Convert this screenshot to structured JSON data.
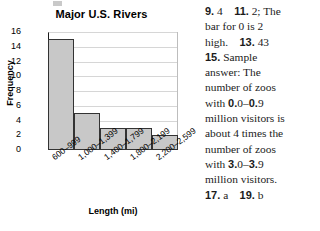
{
  "artifact": {
    "name": "page-edge-mark"
  },
  "chart_data": {
    "type": "bar",
    "title": "Major U.S. Rivers",
    "xlabel": "Length (mi)",
    "ylabel": "Frequency",
    "categories": [
      "600–999",
      "1,000–1,399",
      "1,400–1,799",
      "1,800–2,199",
      "2,200–2,599"
    ],
    "values": [
      15,
      5,
      3,
      3,
      2
    ],
    "yticks": [
      16,
      14,
      12,
      10,
      8,
      6,
      4,
      2,
      0
    ],
    "ylim": [
      0,
      16
    ],
    "grid": true,
    "legend": "none",
    "bar_fill": "#c8c8c8",
    "bar_stroke": "#333333"
  },
  "answers": {
    "lines": [
      "9. 4    11. 2; The",
      "bar for 0 is 2",
      "high.    13. 43",
      "15. Sample",
      "answer: The",
      "number of zoos",
      "with 0.0–0.9",
      "million visitors is",
      "about 4 times the",
      "number of zoos",
      "with 3.0–3.9",
      "million visitors.",
      "17. a    19. b"
    ],
    "items": [
      {
        "num": "9.",
        "text": "4"
      },
      {
        "num": "11.",
        "text": "2; The bar for 0 is 2 high."
      },
      {
        "num": "13.",
        "text": "43"
      },
      {
        "num": "15.",
        "text": "Sample answer: The number of zoos with 0.0–0.9 million visitors is about 4 times the number of zoos with 3.0–3.9 million visitors."
      },
      {
        "num": "17.",
        "text": "a"
      },
      {
        "num": "19.",
        "text": "b"
      }
    ]
  }
}
